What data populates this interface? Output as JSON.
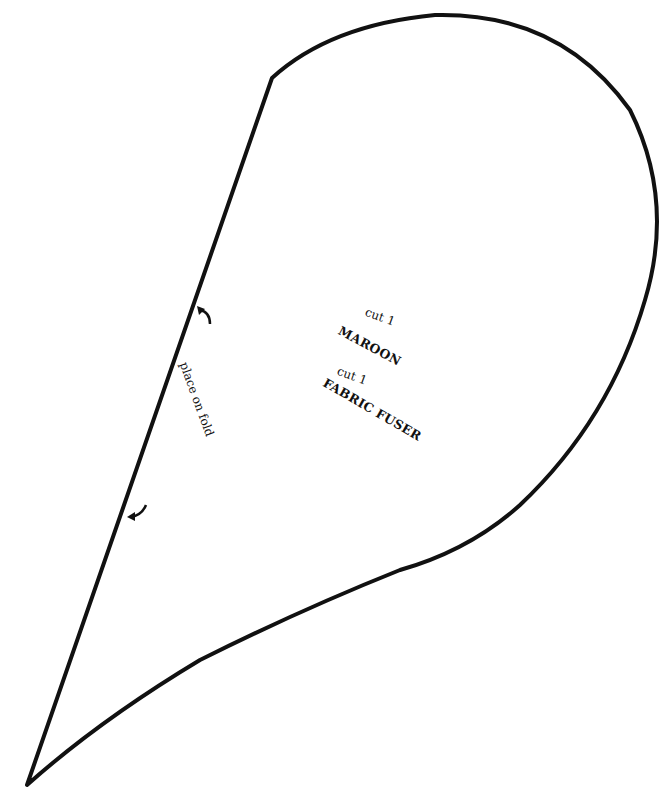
{
  "pattern": {
    "instructions": [
      {
        "qty": "cut 1",
        "material": "MAROON"
      },
      {
        "qty": "cut 1",
        "material": "FABRIC FUSER"
      }
    ],
    "fold_label": "place on fold",
    "outline_color": "#111111",
    "background": "#ffffff"
  }
}
